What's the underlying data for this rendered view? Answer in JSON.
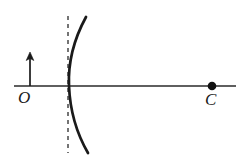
{
  "figure": {
    "background_color": "#ffffff",
    "stroke_color": "#1a1a1a",
    "width": 242,
    "height": 163
  },
  "labels": {
    "object_point": "O",
    "center_of_curvature": "C"
  },
  "elements": {
    "principal_axis": {
      "name": "principal-axis",
      "x1": 14,
      "y1": 86,
      "x2": 236,
      "y2": 86,
      "stroke_width": 1.6
    },
    "object_arrow": {
      "name": "object-arrow",
      "x": 30,
      "base_y": 86,
      "tip_y": 55,
      "stroke_width": 1.6
    },
    "mirror_arc": {
      "name": "concave-mirror-arc",
      "top": [
        86,
        17
      ],
      "vertex": [
        69,
        86
      ],
      "bottom": [
        88,
        153
      ],
      "stroke_width": 2.6,
      "curvature": "concave-left"
    },
    "dashed_line": {
      "name": "mirror-plane-dashed-line",
      "x": 68,
      "y1": 16,
      "y2": 153,
      "dash_pattern": "4 4",
      "stroke_width": 1.4
    },
    "center_point": {
      "name": "center-of-curvature-dot",
      "cx": 212,
      "cy": 86,
      "r": 4.2
    }
  }
}
